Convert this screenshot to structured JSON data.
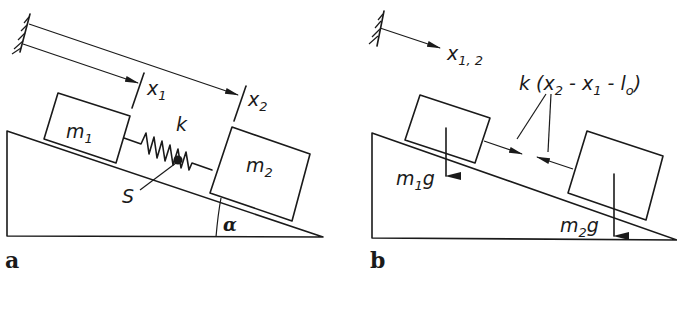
{
  "figure": {
    "panels": [
      {
        "id": "a",
        "label": "a",
        "description": "Two masses on inclined plane connected by spring",
        "masses": [
          {
            "name": "m1",
            "base": "m",
            "subscript": "1"
          },
          {
            "name": "m2",
            "base": "m",
            "subscript": "2"
          }
        ],
        "spring_label": "k",
        "center_point_label": "S",
        "angle_label": "α",
        "coordinates": [
          {
            "base": "x",
            "subscript": "1"
          },
          {
            "base": "x",
            "subscript": "2"
          }
        ]
      },
      {
        "id": "b",
        "label": "b",
        "description": "Free body diagram with gravity and spring forces",
        "coordinate": {
          "base": "x",
          "subscript": "1, 2"
        },
        "spring_force": {
          "prefix": "k (",
          "x2": "x",
          "x2_sub": "2",
          "minus1": " - ",
          "x1": "x",
          "x1_sub": "1",
          "minus2": " - ",
          "l0": "l",
          "l0_sub": "o",
          "suffix": ")"
        },
        "weights": [
          {
            "base": "m",
            "subscript": "1",
            "suffix": "g"
          },
          {
            "base": "m",
            "subscript": "2",
            "suffix": "g"
          }
        ]
      }
    ]
  },
  "colors": {
    "ink": "#1a1a1a",
    "background": "#ffffff"
  }
}
